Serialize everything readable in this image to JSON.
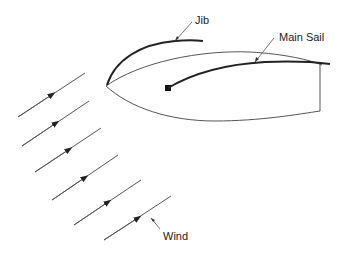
{
  "diagram": {
    "type": "sailboat-wind-diagram",
    "labels": {
      "jib": "Jib",
      "main_sail": "Main Sail",
      "wind": "Wind"
    },
    "colors": {
      "hull_stroke": "#555555",
      "sail_stroke": "#222222",
      "wind_stroke": "#555555",
      "text": "#1a1a1a",
      "background": "#ffffff"
    },
    "wind_arrow_count": 6
  }
}
